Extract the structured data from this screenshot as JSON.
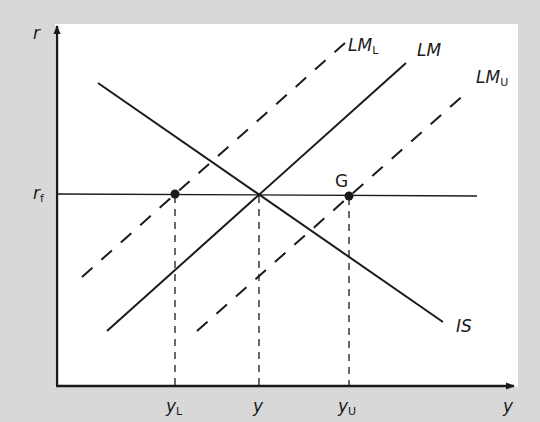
{
  "diagram": {
    "type": "IS-LM diagram",
    "axes": {
      "y_label": "r",
      "x_label": "y"
    },
    "reference_line": {
      "label": "r",
      "subscript": "f"
    },
    "curves": [
      {
        "id": "IS",
        "label": "IS",
        "style": "solid",
        "slope": "downward"
      },
      {
        "id": "LM",
        "label": "LM",
        "style": "solid",
        "slope": "upward"
      },
      {
        "id": "LM_L",
        "label": "LM",
        "subscript": "L",
        "style": "dashed",
        "slope": "upward"
      },
      {
        "id": "LM_U",
        "label": "LM",
        "subscript": "U",
        "style": "dashed",
        "slope": "upward"
      }
    ],
    "points": [
      {
        "id": "G",
        "label": "G"
      }
    ],
    "x_ticks": [
      {
        "label": "y",
        "subscript": "L"
      },
      {
        "label": "y",
        "subscript": ""
      },
      {
        "label": "y",
        "subscript": "U"
      }
    ],
    "colors": {
      "background": "#d8d8d8",
      "panel": "#ffffff",
      "ink": "#1a1a1a"
    }
  }
}
